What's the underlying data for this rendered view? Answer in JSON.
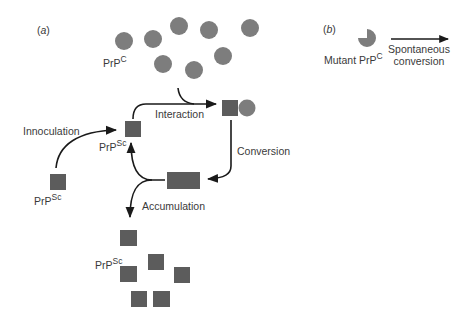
{
  "colors": {
    "square": "#5c5c5c",
    "circle": "#7d7d7d",
    "arrow": "#1a1a1a",
    "text": "#3a3a3a",
    "background": "#ffffff"
  },
  "panel_a": {
    "label_open": "(",
    "label_letter": "a",
    "label_close": ")",
    "prpc_label": {
      "base": "PrP",
      "sup": "C"
    },
    "prpsc_cycle_label": {
      "base": "PrP",
      "sup": "Sc"
    },
    "prpsc_inoculum_label": {
      "base": "PrP",
      "sup": "Sc"
    },
    "prpsc_accumulated_label": {
      "base": "PrP",
      "sup": "Sc"
    },
    "steps": {
      "innoculation": "Innoculation",
      "interaction": "Interaction",
      "conversion": "Conversion",
      "accumulation": "Accumulation"
    }
  },
  "panel_b": {
    "label_open": "(",
    "label_letter": "b",
    "label_close": ")",
    "mutant_label": {
      "base": "Mutant PrP",
      "sup": "C"
    },
    "arrow_label_line1": "Spontaneous",
    "arrow_label_line2": "conversion"
  }
}
